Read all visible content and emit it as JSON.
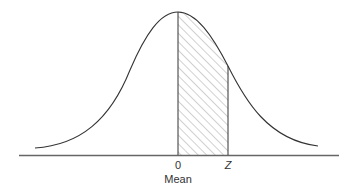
{
  "diagram": {
    "type": "normal-distribution",
    "labels": {
      "zero": "0",
      "z": "Z",
      "mean": "Mean"
    },
    "shaded_region": {
      "from": "0",
      "to": "Z",
      "pattern": "diagonal-hatch"
    },
    "colors": {
      "curve": "#333333",
      "axis": "#666666",
      "hatch": "#888888",
      "background": "#ffffff"
    }
  }
}
